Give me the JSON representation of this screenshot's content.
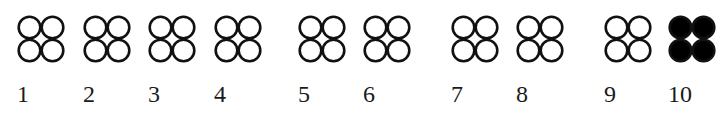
{
  "figure": {
    "colors": {
      "stroke": "#111111",
      "fill_open": "#ffffff",
      "fill_solid": "#000000"
    },
    "items": [
      {
        "label": "1",
        "x": 17,
        "filled": false
      },
      {
        "label": "2",
        "x": 83,
        "filled": false
      },
      {
        "label": "3",
        "x": 148,
        "filled": false
      },
      {
        "label": "4",
        "x": 214,
        "filled": false
      },
      {
        "label": "5",
        "x": 298,
        "filled": false
      },
      {
        "label": "6",
        "x": 363,
        "filled": false
      },
      {
        "label": "7",
        "x": 451,
        "filled": false
      },
      {
        "label": "8",
        "x": 516,
        "filled": false
      },
      {
        "label": "9",
        "x": 604,
        "filled": false
      },
      {
        "label": "10",
        "x": 668,
        "filled": true
      }
    ]
  }
}
